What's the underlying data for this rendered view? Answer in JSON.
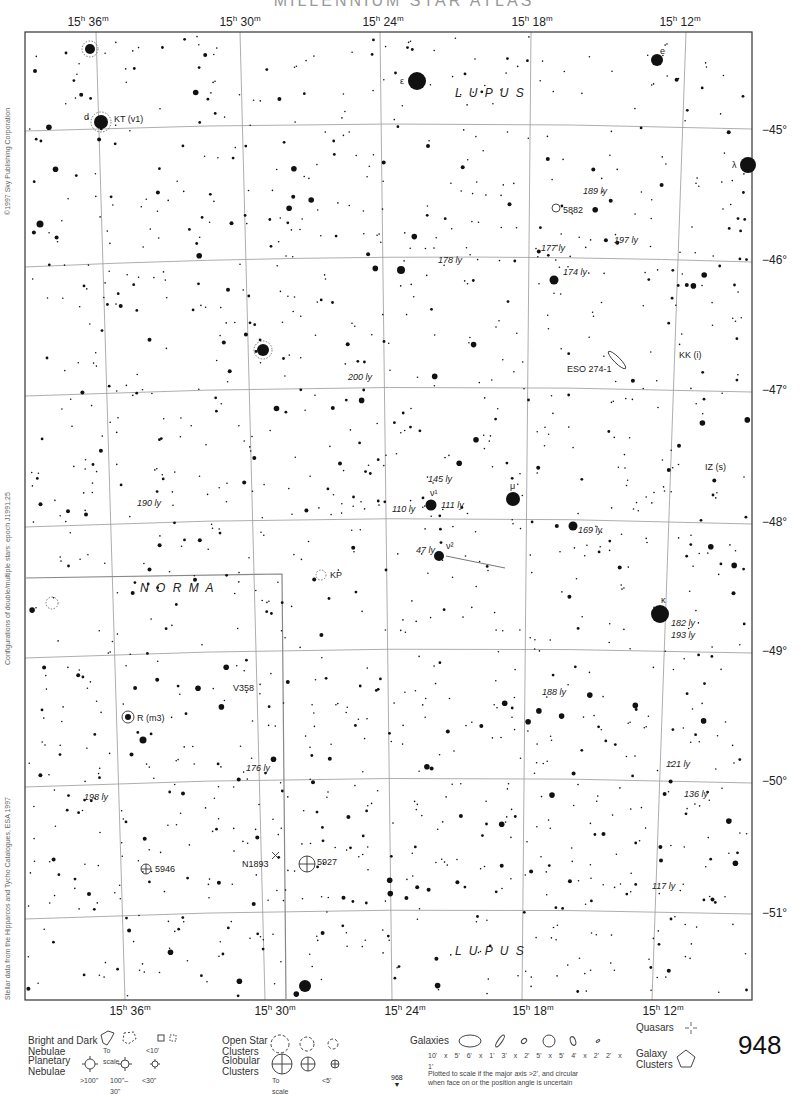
{
  "header": {
    "title": "MILLENNIUM STAR ATLAS"
  },
  "map": {
    "ra_labels_top": [
      {
        "h": "15",
        "m": "36",
        "x": 88
      },
      {
        "h": "15",
        "m": "30",
        "x": 240
      },
      {
        "h": "15",
        "m": "24",
        "x": 383
      },
      {
        "h": "15",
        "m": "18",
        "x": 532
      },
      {
        "h": "15",
        "m": "12",
        "x": 680
      }
    ],
    "ra_labels_bottom": [
      {
        "h": "15",
        "m": "36",
        "x": 130
      },
      {
        "h": "15",
        "m": "30",
        "x": 275
      },
      {
        "h": "15",
        "m": "24",
        "x": 405
      },
      {
        "h": "15",
        "m": "18",
        "x": 533
      },
      {
        "h": "15",
        "m": "12",
        "x": 663
      }
    ],
    "dec_labels": [
      {
        "text": "−45°",
        "y": 130
      },
      {
        "text": "−46°",
        "y": 260
      },
      {
        "text": "−47°",
        "y": 390
      },
      {
        "text": "−48°",
        "y": 522
      },
      {
        "text": "−49°",
        "y": 651
      },
      {
        "text": "−50°",
        "y": 781
      },
      {
        "text": "−51°",
        "y": 913
      }
    ],
    "constellations": [
      {
        "name": "L U P U S",
        "x": 455,
        "y": 97
      },
      {
        "name": "N O R M A",
        "x": 140,
        "y": 592
      },
      {
        "name": "L U P U S",
        "x": 455,
        "y": 955
      }
    ],
    "star_labels": [
      {
        "text": "ε",
        "x": 400,
        "y": 84,
        "italic": false
      },
      {
        "text": "e",
        "x": 660,
        "y": 54,
        "italic": false
      },
      {
        "text": "d",
        "x": 84,
        "y": 120,
        "italic": false
      },
      {
        "text": "KT (v1)",
        "x": 114,
        "y": 122,
        "italic": false
      },
      {
        "text": "λ",
        "x": 732,
        "y": 168,
        "italic": false
      },
      {
        "text": "189 ly",
        "x": 583,
        "y": 194,
        "italic": true
      },
      {
        "text": "5882",
        "x": 563,
        "y": 213,
        "italic": false
      },
      {
        "text": "197 ly",
        "x": 614,
        "y": 243,
        "italic": true
      },
      {
        "text": "177 ly",
        "x": 541,
        "y": 251,
        "italic": true
      },
      {
        "text": "178 ly",
        "x": 438,
        "y": 263,
        "italic": true
      },
      {
        "text": "174 ly",
        "x": 563,
        "y": 275,
        "italic": true
      },
      {
        "text": "KK (i)",
        "x": 679,
        "y": 358,
        "italic": false
      },
      {
        "text": "ESO 274-1",
        "x": 567,
        "y": 372,
        "italic": false
      },
      {
        "text": "200 ly",
        "x": 348,
        "y": 380,
        "italic": true
      },
      {
        "text": "IZ (s)",
        "x": 705,
        "y": 470,
        "italic": false
      },
      {
        "text": "145 ly",
        "x": 428,
        "y": 482,
        "italic": true
      },
      {
        "text": "μ",
        "x": 510,
        "y": 489,
        "italic": false
      },
      {
        "text": "ν¹",
        "x": 430,
        "y": 496,
        "italic": false
      },
      {
        "text": "111 ly",
        "x": 441,
        "y": 508,
        "italic": true
      },
      {
        "text": "110 ly",
        "x": 392,
        "y": 512,
        "italic": true
      },
      {
        "text": "190 ly",
        "x": 137,
        "y": 506,
        "italic": true
      },
      {
        "text": "169 ly",
        "x": 578,
        "y": 533,
        "italic": true
      },
      {
        "text": "47 ly",
        "x": 416,
        "y": 553,
        "italic": true
      },
      {
        "text": "ν²",
        "x": 446,
        "y": 549,
        "italic": false
      },
      {
        "text": "KP",
        "x": 330,
        "y": 578,
        "italic": false
      },
      {
        "text": "κ",
        "x": 661,
        "y": 603,
        "italic": false
      },
      {
        "text": "182 ly",
        "x": 671,
        "y": 626,
        "italic": true
      },
      {
        "text": "193 ly",
        "x": 671,
        "y": 638,
        "italic": true
      },
      {
        "text": "188 ly",
        "x": 542,
        "y": 695,
        "italic": true
      },
      {
        "text": "V358",
        "x": 233,
        "y": 691,
        "italic": false
      },
      {
        "text": "R (m3)",
        "x": 137,
        "y": 721,
        "italic": false
      },
      {
        "text": "176 ly",
        "x": 246,
        "y": 771,
        "italic": true
      },
      {
        "text": "121 ly",
        "x": 666,
        "y": 767,
        "italic": true
      },
      {
        "text": "136 ly",
        "x": 684,
        "y": 797,
        "italic": true
      },
      {
        "text": "198 ly",
        "x": 84,
        "y": 800,
        "italic": true
      },
      {
        "text": "N1893",
        "x": 242,
        "y": 867,
        "italic": false
      },
      {
        "text": "5927",
        "x": 317,
        "y": 865,
        "italic": false
      },
      {
        "text": "5946",
        "x": 155,
        "y": 872,
        "italic": false
      },
      {
        "text": "117 ly",
        "x": 652,
        "y": 889,
        "italic": true
      }
    ],
    "side_texts": {
      "copyright": "©1997 Sky Publishing Corporation",
      "configurations": "Configurations of double/multiple stars: epoch J1991.25",
      "stellar_data": "Stellar data from the Hipparcos and Tycho Catalogues, ESA 1997"
    }
  },
  "legend": {
    "nebulae": {
      "label1": "Bright and Dark",
      "label2": "Nebulae",
      "to_scale": "To scale",
      "small": "<10'"
    },
    "planetary": {
      "label1": "Planetary",
      "label2": "Nebulae",
      "sizes": [
        ">100\"",
        "100\"–30\"",
        "<30\""
      ]
    },
    "open_clusters": {
      "label1": "Open Star",
      "label2": "Clusters"
    },
    "globular": {
      "label1": "Globular",
      "label2": "Clusters",
      "to_scale": "To scale",
      "small": "<5'"
    },
    "galaxies": {
      "label": "Galaxies",
      "sizes": [
        "10' x 5'",
        "6' x 1'",
        "3' x 2'",
        "5' x 5'",
        "4' x 2'",
        "2' x 1'"
      ],
      "note1": "Plotted to scale if the major axis >2', and circular",
      "note2": "when face on or the position angle is uncertain"
    },
    "quasars": {
      "label": "Quasars"
    },
    "galaxy_clusters": {
      "label1": "Galaxy",
      "label2": "Clusters"
    }
  },
  "page": {
    "number": "948",
    "next": "968"
  }
}
